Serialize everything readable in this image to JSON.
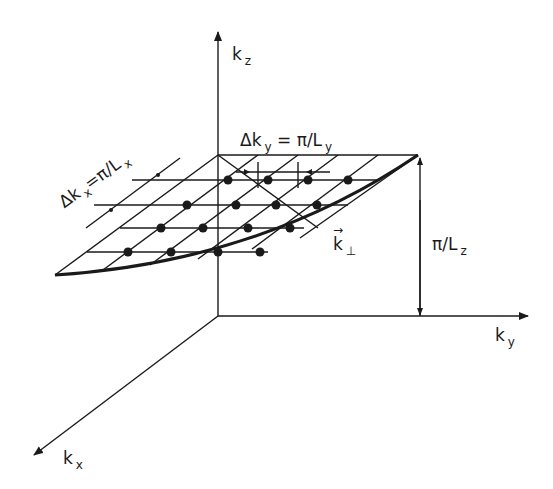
{
  "figure": {
    "type": "3D k-space lattice diagram",
    "axes": {
      "kz": {
        "main": "k",
        "sub": "z"
      },
      "ky": {
        "main": "k",
        "sub": "y"
      },
      "kx": {
        "main": "k",
        "sub": "x"
      }
    },
    "labels": {
      "delta_ky": {
        "main": "Δk",
        "sub": "y",
        "rest": " = π/L",
        "rest_sub": "y"
      },
      "delta_kx": {
        "main": "Δk",
        "sub": "x",
        "rest": "=π/L",
        "rest_sub": "x"
      },
      "k_perp": {
        "main": "k",
        "sub": "⊥",
        "arrow": "→"
      },
      "pi_lz": {
        "main": "π/L",
        "sub": "z"
      }
    },
    "colors": {
      "ink": "#1a1a1a",
      "background": "#ffffff"
    }
  }
}
